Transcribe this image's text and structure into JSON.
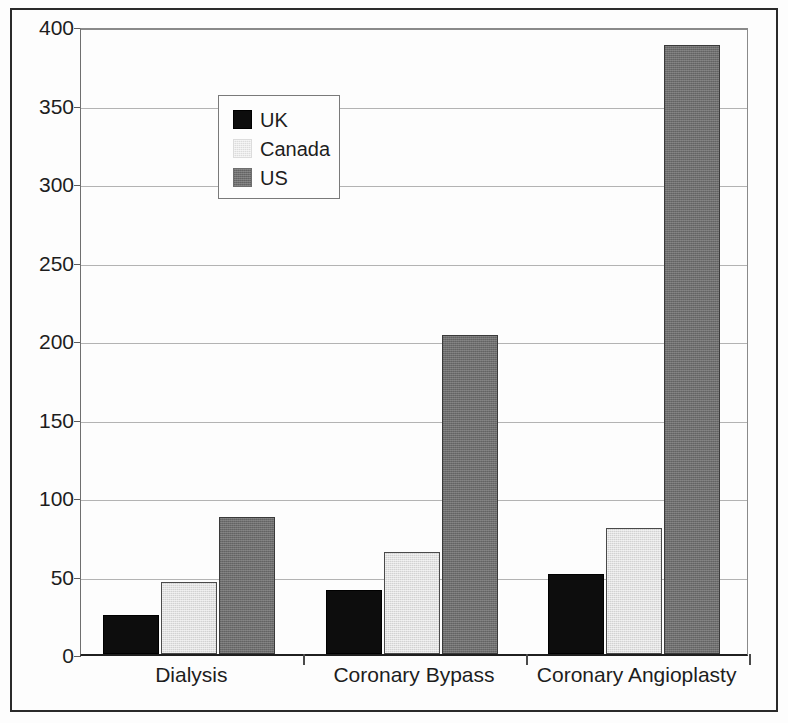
{
  "chart_data": {
    "type": "bar",
    "title": "",
    "subtitle": "",
    "xlabel": "",
    "ylabel": "",
    "categories": [
      "Dialysis",
      "Coronary Bypass",
      "Coronary Angioplasty"
    ],
    "series": [
      {
        "name": "UK",
        "values": [
          25,
          41,
          51
        ],
        "color": "#0d0d0d"
      },
      {
        "name": "Canada",
        "values": [
          46,
          65,
          80
        ],
        "color": "#d2d2d2"
      },
      {
        "name": "US",
        "values": [
          87,
          203,
          388
        ],
        "color": "#6e6e6e"
      }
    ],
    "ylim": [
      0,
      400
    ],
    "yticks": [
      0,
      50,
      100,
      150,
      200,
      250,
      300,
      350,
      400
    ],
    "ytick_labels": [
      "0",
      "50",
      "100",
      "150",
      "200",
      "250",
      "300",
      "350",
      "400"
    ],
    "grid": true,
    "grid_axis": "y",
    "legend": {
      "position": "upper-left-inside",
      "entries": [
        "UK",
        "Canada",
        "US"
      ]
    },
    "bar_group_mode": "grouped"
  },
  "colors": {
    "uk": "#0d0d0d",
    "canada": "#d2d2d2",
    "us": "#6e6e6e",
    "frame": "#2b2b2b",
    "gridline": "#b3b3b3",
    "text": "#1d1d1d",
    "background": "#fdfdfd"
  }
}
